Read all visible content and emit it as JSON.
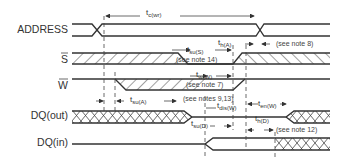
{
  "diagram": {
    "type": "timing-diagram",
    "signals": [
      {
        "id": "address",
        "label": "ADDRESS",
        "overbar": false
      },
      {
        "id": "s",
        "label": "S",
        "overbar": true
      },
      {
        "id": "w",
        "label": "W",
        "overbar": true
      },
      {
        "id": "dq_out",
        "label": "DQ(out)",
        "overbar": false
      },
      {
        "id": "dq_in",
        "label": "DQ(in)",
        "overbar": false
      }
    ],
    "timings": [
      {
        "id": "tc_wr",
        "main": "t",
        "sub": "c(wr)"
      },
      {
        "id": "th_a",
        "main": "t",
        "sub": "h(A)"
      },
      {
        "id": "tsu_s",
        "main": "t",
        "sub": "su(S)",
        "note": "(see note 14)"
      },
      {
        "id": "tw_w",
        "main": "t",
        "sub": "w(W)",
        "note": "(see note 7)"
      },
      {
        "id": "tsu_a",
        "main": "t",
        "sub": "su(A)"
      },
      {
        "id": "tdis_w",
        "main": "t",
        "sub": "dis(W)",
        "note": "(see notes 9,13)"
      },
      {
        "id": "ten_w",
        "main": "t",
        "sub": "en(W)"
      },
      {
        "id": "tsu_d",
        "main": "t",
        "sub": "su(D)"
      },
      {
        "id": "th_d",
        "main": "t",
        "sub": "h(D)",
        "note": "(see note 12)"
      }
    ],
    "notes": {
      "note8": "(see note 8)"
    },
    "colors": {
      "line": "#333333",
      "background": "#ffffff"
    }
  }
}
